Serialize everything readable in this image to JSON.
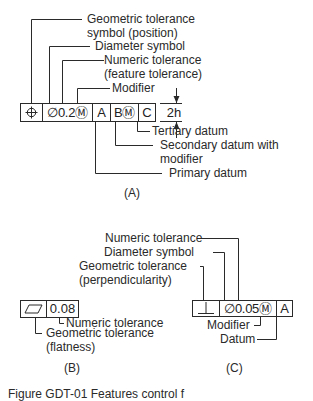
{
  "figure": {
    "caption": "Figure GDT-01 Features control f",
    "panels": {
      "A": {
        "label": "(A)",
        "frame_cells": [
          "⌖",
          "∅0.2Ⓜ",
          "A",
          "BⓂ",
          "C"
        ],
        "cell_names": [
          "position-symbol",
          "diameter-tolerance-modifier",
          "primary-datum",
          "secondary-datum-modifier",
          "tertiary-datum"
        ],
        "dimension": "2h",
        "callouts": {
          "geo_symbol_line1": "Geometric tolerance",
          "geo_symbol_line2": "symbol (position)",
          "diameter": "Diameter symbol",
          "numeric_line1": "Numeric tolerance",
          "numeric_line2": "(feature tolerance)",
          "modifier": "Modifier",
          "tertiary": "Tertiary datum",
          "secondary_line1": "Secondary datum with",
          "secondary_line2": "modifier",
          "primary": "Primary datum"
        }
      },
      "B": {
        "label": "(B)",
        "frame_cells": [
          "▱",
          "0.08"
        ],
        "callouts": {
          "numeric": "Numeric tolerance",
          "geo_line1": "Geometric tolerance",
          "geo_line2": "(flatness)"
        }
      },
      "C": {
        "label": "(C)",
        "frame_cells": [
          "⊥",
          "∅0.05Ⓜ",
          "A"
        ],
        "callouts": {
          "numeric": "Numeric tolerance",
          "diameter": "Diameter symbol",
          "geo_line1": "Geometric tolerance",
          "geo_line2": "(perpendicularity)",
          "modifier": "Modifier",
          "datum": "Datum"
        }
      }
    },
    "colors": {
      "line": "#2a2a2a",
      "background": "#ffffff"
    }
  }
}
